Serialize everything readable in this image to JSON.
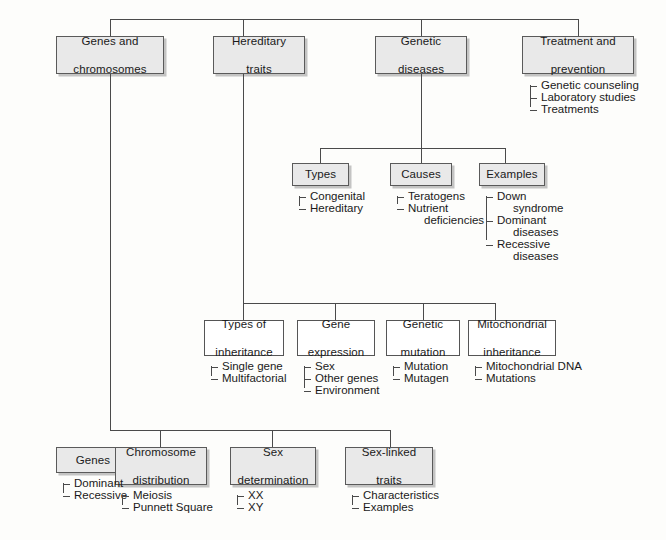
{
  "diagram": {
    "type": "hierarchy-concept-map",
    "topic": "Genes and chromosomes / heredity concept map",
    "line_color": "#4a4a4a",
    "shaded_box_fill": "#e9e9e9",
    "plain_box_fill": "#ffffff"
  },
  "level1": [
    {
      "id": "genes_chromosomes",
      "label_line1": "Genes and",
      "label_line2": "chromosomes"
    },
    {
      "id": "hereditary_traits",
      "label_line1": "Hereditary",
      "label_line2": "traits"
    },
    {
      "id": "genetic_diseases",
      "label_line1": "Genetic",
      "label_line2": "diseases"
    },
    {
      "id": "treatment_prevention",
      "label_line1": "Treatment and",
      "label_line2": "prevention"
    }
  ],
  "treatment_items": [
    "Genetic counseling",
    "Laboratory studies",
    "Treatments"
  ],
  "disease_children": [
    {
      "id": "types",
      "label": "Types",
      "items": [
        "Congenital",
        "Hereditary"
      ]
    },
    {
      "id": "causes",
      "label": "Causes",
      "items_head": [
        "Teratogens",
        "Nutrient"
      ],
      "items": [
        {
          "head": "Teratogens",
          "cont": ""
        },
        {
          "head": "Nutrient",
          "cont": "deficiencies"
        }
      ]
    },
    {
      "id": "examples",
      "label": "Examples",
      "items": [
        {
          "head": "Down",
          "cont": "syndrome"
        },
        {
          "head": "Dominant",
          "cont": "diseases"
        },
        {
          "head": "Recessive",
          "cont": "diseases"
        }
      ]
    }
  ],
  "hereditary_children": [
    {
      "id": "types_of_inheritance",
      "label_line1": "Types of",
      "label_line2": "inheritance",
      "items": [
        "Single gene",
        "Multifactorial"
      ]
    },
    {
      "id": "gene_expression",
      "label_line1": "Gene",
      "label_line2": "expression",
      "items": [
        "Sex",
        "Other genes",
        "Environment"
      ]
    },
    {
      "id": "genetic_mutation",
      "label_line1": "Genetic",
      "label_line2": "mutation",
      "items": [
        "Mutation",
        "Mutagen"
      ]
    },
    {
      "id": "mitochondrial_inheritance",
      "label_line1": "Mitochondrial",
      "label_line2": "inheritance",
      "items": [
        "Mitochondrial DNA",
        "Mutations"
      ]
    }
  ],
  "gene_children": [
    {
      "id": "genes",
      "label_line1": "Genes",
      "label_line2": "",
      "items": [
        "Dominant",
        "Recessive"
      ]
    },
    {
      "id": "chromosome_distribution",
      "label_line1": "Chromosome",
      "label_line2": "distribution",
      "items": [
        "Meiosis",
        "Punnett Square"
      ]
    },
    {
      "id": "sex_determination",
      "label_line1": "Sex",
      "label_line2": "determination",
      "items": [
        "XX",
        "XY"
      ]
    },
    {
      "id": "sex_linked_traits",
      "label_line1": "Sex-linked",
      "label_line2": "traits",
      "items": [
        "Characteristics",
        "Examples"
      ]
    }
  ]
}
